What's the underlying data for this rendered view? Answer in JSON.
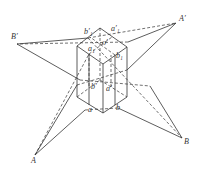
{
  "diagram": {
    "type": "geometric-projection",
    "stroke_color": "#333333",
    "labels": {
      "A": "A",
      "B": "B",
      "A_prime": "A′",
      "B_prime": "B′",
      "a": "a",
      "b": "b",
      "a_prime": "a′",
      "b_prime": "b′",
      "a1": "a₁",
      "b1": "b₁",
      "a1_prime": "a′₁",
      "b1_prime": "b′₁",
      "o_prime": "o′"
    }
  }
}
